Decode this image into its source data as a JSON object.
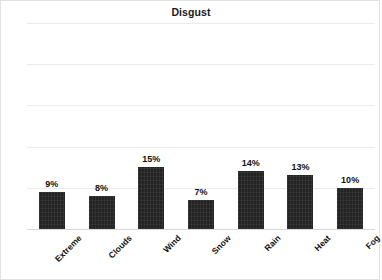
{
  "chart_data": {
    "type": "bar",
    "title": "Disgust",
    "xlabel": "",
    "ylabel": "",
    "categories": [
      "Extreme",
      "Clouds",
      "Wind",
      "Snow",
      "Rain",
      "Heat",
      "Fog"
    ],
    "values": [
      9,
      8,
      15,
      7,
      14,
      13,
      10
    ],
    "data_labels": [
      "9%",
      "8%",
      "15%",
      "7%",
      "14%",
      "13%",
      "10%"
    ],
    "ylim": [
      0,
      50
    ],
    "yticks": [
      0,
      10,
      20,
      30,
      40,
      50
    ],
    "ytick_labels": [
      "0%",
      "10%",
      "20%",
      "30%",
      "40%",
      "50%"
    ],
    "grid": true,
    "legend": false,
    "bar_color": "#232323",
    "gridline_color": "#ebebeb",
    "background_color": "#ffffff"
  }
}
